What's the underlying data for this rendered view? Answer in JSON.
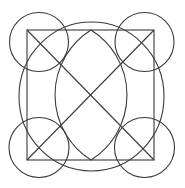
{
  "diagram": {
    "title": "",
    "canvas": {
      "width": 185,
      "height": 188,
      "background": "#ffffff"
    },
    "stroke_color": "#3a3a3a",
    "square": {
      "x": 27,
      "y": 30,
      "width": 127,
      "height": 130
    },
    "diagonals": [
      {
        "x1": 27,
        "y1": 30,
        "x2": 154,
        "y2": 160
      },
      {
        "x1": 154,
        "y1": 30,
        "x2": 27,
        "y2": 160
      }
    ],
    "outer_ellipse": {
      "cx": 91.5,
      "cy": 96.5,
      "rx": 72.5,
      "ry": 74.5
    },
    "lens": {
      "top": {
        "x": 91,
        "y": 30
      },
      "bottom": {
        "x": 91,
        "y": 160
      },
      "arc_radius": 76.7
    },
    "corner_circles": [
      {
        "name": "top-left",
        "cx": 39,
        "cy": 42,
        "r": 29.5
      },
      {
        "name": "top-right",
        "cx": 144.5,
        "cy": 42,
        "r": 29.5
      },
      {
        "name": "bottom-left",
        "cx": 39,
        "cy": 147.5,
        "r": 30
      },
      {
        "name": "bottom-right",
        "cx": 144.5,
        "cy": 147.5,
        "r": 30
      }
    ]
  }
}
